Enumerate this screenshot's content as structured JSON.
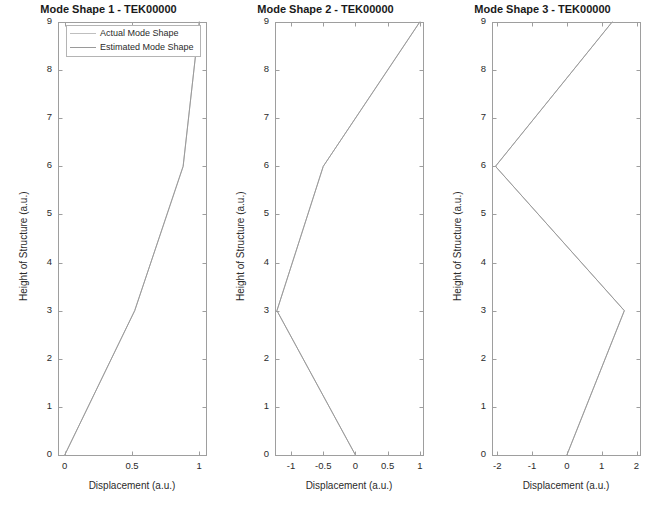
{
  "figure": {
    "background": "#ffffff",
    "width": 651,
    "height": 508
  },
  "legend": {
    "actual_label": "Actual Mode Shape",
    "estimated_label": "Estimated Mode Shape",
    "actual_color": "#bfbfbf",
    "estimated_color": "#9a9a9a",
    "position": "top-left-subplot-1"
  },
  "chart_data": [
    {
      "type": "line",
      "title": "Mode Shape 1 - TEK00000",
      "xlabel": "Displacement (a.u.)",
      "ylabel": "Height of Structure (a.u.)",
      "xlim": [
        -0.05,
        1.05
      ],
      "ylim": [
        0,
        9
      ],
      "xticks": [
        0,
        0.5,
        1
      ],
      "xticklabels": [
        "0",
        "0.5",
        "1"
      ],
      "yticks": [
        0,
        1,
        2,
        3,
        4,
        5,
        6,
        7,
        8,
        9
      ],
      "yticklabels": [
        "0",
        "1",
        "2",
        "3",
        "4",
        "5",
        "6",
        "7",
        "8",
        "9"
      ],
      "grid": false,
      "series": [
        {
          "name": "Actual Mode Shape",
          "color": "#bfbfbf",
          "x": [
            0.0,
            0.52,
            0.88,
            1.0
          ],
          "y": [
            0,
            3,
            6,
            9
          ]
        },
        {
          "name": "Estimated Mode Shape",
          "color": "#9a9a9a",
          "x": [
            0.0,
            0.52,
            0.88,
            1.0
          ],
          "y": [
            0,
            3,
            6,
            9
          ]
        }
      ]
    },
    {
      "type": "line",
      "title": "Mode Shape 2 - TEK00000",
      "xlabel": "Displacement (a.u.)",
      "ylabel": "Height of Structure (a.u.)",
      "xlim": [
        -1.25,
        1.05
      ],
      "ylim": [
        0,
        9
      ],
      "xticks": [
        -1,
        -0.5,
        0,
        0.5,
        1
      ],
      "xticklabels": [
        "-1",
        "-0.5",
        "0",
        "0.5",
        "1"
      ],
      "yticks": [
        0,
        1,
        2,
        3,
        4,
        5,
        6,
        7,
        8,
        9
      ],
      "yticklabels": [
        "0",
        "1",
        "2",
        "3",
        "4",
        "5",
        "6",
        "7",
        "8",
        "9"
      ],
      "grid": false,
      "series": [
        {
          "name": "Actual Mode Shape",
          "color": "#bfbfbf",
          "x": [
            0.0,
            -1.22,
            -0.5,
            1.0
          ],
          "y": [
            0,
            3,
            6,
            9
          ]
        },
        {
          "name": "Estimated Mode Shape",
          "color": "#9a9a9a",
          "x": [
            0.0,
            -1.22,
            -0.5,
            1.0
          ],
          "y": [
            0,
            3,
            6,
            9
          ]
        }
      ]
    },
    {
      "type": "line",
      "title": "Mode Shape 3 - TEK00000",
      "xlabel": "Displacement (a.u.)",
      "ylabel": "Height of Structure (a.u.)",
      "xlim": [
        -2.15,
        2.1
      ],
      "ylim": [
        0,
        9
      ],
      "xticks": [
        -2,
        -1,
        0,
        1,
        2
      ],
      "xticklabels": [
        "-2",
        "-1",
        "0",
        "1",
        "2"
      ],
      "yticks": [
        0,
        1,
        2,
        3,
        4,
        5,
        6,
        7,
        8,
        9
      ],
      "yticklabels": [
        "0",
        "1",
        "2",
        "3",
        "4",
        "5",
        "6",
        "7",
        "8",
        "9"
      ],
      "grid": false,
      "series": [
        {
          "name": "Actual Mode Shape",
          "color": "#bfbfbf",
          "x": [
            0.0,
            1.65,
            -2.05,
            1.3
          ],
          "y": [
            0,
            3,
            6,
            9
          ]
        },
        {
          "name": "Estimated Mode Shape",
          "color": "#9a9a9a",
          "x": [
            0.0,
            1.65,
            -2.05,
            1.3
          ],
          "y": [
            0,
            3,
            6,
            9
          ]
        }
      ]
    }
  ]
}
